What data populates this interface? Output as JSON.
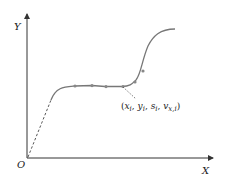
{
  "axes": {
    "x_label": "X",
    "y_label": "Y",
    "origin_label": "O"
  },
  "annotation": {
    "open_paren": "(",
    "x": "x",
    "x_sub": "i",
    "sep1": ", ",
    "y": "y",
    "y_sub": "i",
    "sep2": ", ",
    "s": "s",
    "s_sub": "i",
    "sep3": ", ",
    "v": "v",
    "v_sub": "x,i",
    "close_paren": ")"
  },
  "colors": {
    "curve": "#777777",
    "points": "#888888",
    "axis": "#333333",
    "dashed": "#444444"
  },
  "trajectory_points_count": 6
}
